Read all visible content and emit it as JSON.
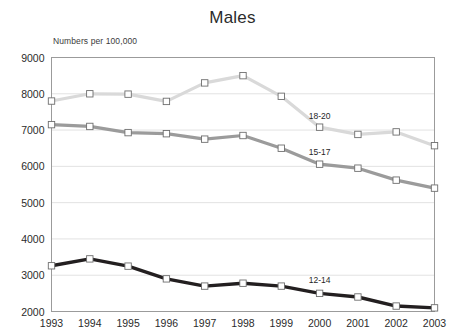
{
  "chart_data": {
    "type": "line",
    "title": "Males",
    "subtitle": "Numbers per 100,000",
    "xlabel": "",
    "ylabel": "",
    "ylim": [
      2000,
      9000
    ],
    "ytick_step": 1000,
    "yticks": [
      2000,
      3000,
      4000,
      5000,
      6000,
      7000,
      8000,
      9000
    ],
    "grid": true,
    "legend": "inline-series-labels",
    "categories": [
      1993,
      1994,
      1995,
      1996,
      1997,
      1998,
      1999,
      2000,
      2001,
      2002,
      2003
    ],
    "xtick_labels": [
      "1993",
      "1994",
      "1995",
      "1996",
      "1997",
      "1998",
      "1999",
      "2000",
      "2001",
      "2002",
      "2003"
    ],
    "series": [
      {
        "name": "18-20",
        "label": "18-20",
        "color": "#d9d9d9",
        "marker": "square",
        "values": [
          7800,
          8000,
          7990,
          7790,
          8300,
          8500,
          7930,
          7080,
          6880,
          6950,
          6570
        ]
      },
      {
        "name": "15-17",
        "label": "15-17",
        "color": "#9b9b9b",
        "marker": "square",
        "values": [
          7150,
          7100,
          6930,
          6900,
          6750,
          6850,
          6500,
          6060,
          5950,
          5620,
          5400
        ]
      },
      {
        "name": "12-14",
        "label": "12-14",
        "color": "#231f20",
        "marker": "square",
        "values": [
          3260,
          3450,
          3250,
          2900,
          2700,
          2780,
          2700,
          2500,
          2400,
          2150,
          2100
        ]
      }
    ],
    "series_label_positions": [
      {
        "label": "18-20",
        "x_year": 2000.0,
        "y_value": 7300
      },
      {
        "label": "15-17",
        "x_year": 2000.0,
        "y_value": 6300
      },
      {
        "label": "12-14",
        "x_year": 2000.0,
        "y_value": 2780
      }
    ],
    "colors": {
      "background": "#ffffff",
      "plot_border": "#9b9b9b",
      "gridline": "#e2e2e2",
      "marker_fill": "#ffffff",
      "marker_stroke": "#6e6e6e",
      "text": "#231f20"
    }
  }
}
